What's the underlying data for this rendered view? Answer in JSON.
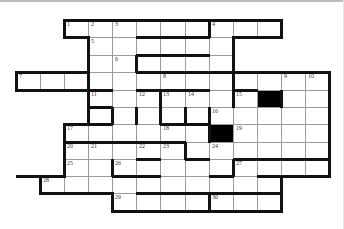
{
  "puzzle": {
    "type": "crossword",
    "colors": {
      "cell": "#ffffff",
      "block": "#000000",
      "thin_line": "#9a9a9a",
      "thick_line": "#111111"
    },
    "col_x": [
      16,
      40,
      64,
      88,
      112,
      136,
      160,
      185,
      209,
      233,
      257,
      281,
      305,
      329
    ],
    "row_y": [
      20,
      37,
      55,
      72,
      90,
      107,
      124,
      142,
      159,
      176,
      193,
      211
    ],
    "rows": [
      {
        "r": 0,
        "from": 2,
        "to": 10
      },
      {
        "r": 1,
        "from": 3,
        "to": 8
      },
      {
        "r": 2,
        "from": 3,
        "to": 8
      },
      {
        "r": 3,
        "from": 0,
        "to": 12
      },
      {
        "r": 4,
        "from": 3,
        "to": 12
      },
      {
        "r": 5,
        "from": 3,
        "to": 12
      },
      {
        "r": 6,
        "from": 2,
        "to": 12
      },
      {
        "r": 7,
        "from": 2,
        "to": 12
      },
      {
        "r": 8,
        "from": 2,
        "to": 12
      },
      {
        "r": 9,
        "from": 1,
        "to": 10
      },
      {
        "r": 10,
        "from": 4,
        "to": 10
      }
    ],
    "blocks": [
      [
        4,
        10
      ],
      [
        6,
        8
      ]
    ],
    "numbers": [
      {
        "n": "1",
        "r": 0,
        "c": 2
      },
      {
        "n": "2",
        "r": 0,
        "c": 3
      },
      {
        "n": "3",
        "r": 0,
        "c": 4
      },
      {
        "n": "4",
        "r": 0,
        "c": 8
      },
      {
        "n": "5",
        "r": 1,
        "c": 3
      },
      {
        "n": "6",
        "r": 2,
        "c": 4
      },
      {
        "n": "7",
        "r": 3,
        "c": 0
      },
      {
        "n": "8",
        "r": 3,
        "c": 6
      },
      {
        "n": "9",
        "r": 3,
        "c": 11
      },
      {
        "n": "10",
        "r": 3,
        "c": 12
      },
      {
        "n": "11",
        "r": 4,
        "c": 3
      },
      {
        "n": "12",
        "r": 4,
        "c": 5
      },
      {
        "n": "13",
        "r": 4,
        "c": 6
      },
      {
        "n": "14",
        "r": 4,
        "c": 7
      },
      {
        "n": "15",
        "r": 4,
        "c": 9
      },
      {
        "n": "16",
        "r": 5,
        "c": 8
      },
      {
        "n": "17",
        "r": 6,
        "c": 2
      },
      {
        "n": "18",
        "r": 6,
        "c": 6
      },
      {
        "n": "19",
        "r": 6,
        "c": 9
      },
      {
        "n": "20",
        "r": 7,
        "c": 2
      },
      {
        "n": "21",
        "r": 7,
        "c": 3
      },
      {
        "n": "22",
        "r": 7,
        "c": 5
      },
      {
        "n": "23",
        "r": 7,
        "c": 6
      },
      {
        "n": "24",
        "r": 7,
        "c": 8
      },
      {
        "n": "25",
        "r": 8,
        "c": 2
      },
      {
        "n": "26",
        "r": 8,
        "c": 4
      },
      {
        "n": "27",
        "r": 8,
        "c": 9
      },
      {
        "n": "28",
        "r": 9,
        "c": 1
      },
      {
        "n": "29",
        "r": 10,
        "c": 4
      },
      {
        "n": "30",
        "r": 10,
        "c": 8
      }
    ],
    "thick_h": [
      [
        0,
        2,
        11
      ],
      [
        1,
        2,
        3
      ],
      [
        1,
        5,
        8
      ],
      [
        1,
        9,
        11
      ],
      [
        2,
        5,
        8
      ],
      [
        3,
        0,
        3
      ],
      [
        3,
        5,
        8
      ],
      [
        3,
        8,
        13
      ],
      [
        4,
        0,
        4
      ],
      [
        4,
        5,
        8
      ],
      [
        4,
        9,
        10
      ],
      [
        5,
        3,
        4
      ],
      [
        6,
        2,
        3
      ],
      [
        6,
        3,
        4
      ],
      [
        6,
        6,
        8
      ],
      [
        7,
        2,
        5
      ],
      [
        7,
        5,
        7
      ],
      [
        8,
        9,
        13
      ],
      [
        9,
        5,
        6
      ],
      [
        9,
        0,
        2
      ],
      [
        9,
        8,
        9
      ],
      [
        9,
        10,
        13
      ],
      [
        10,
        1,
        4
      ],
      [
        10,
        5,
        8
      ],
      [
        10,
        8,
        11
      ],
      [
        11,
        4,
        11
      ],
      [
        8,
        5,
        6
      ],
      [
        8,
        7,
        8
      ],
      [
        9,
        4,
        5
      ]
    ],
    "thick_v": [
      [
        0,
        2,
        1
      ],
      [
        0,
        8,
        1
      ],
      [
        0,
        11,
        1
      ],
      [
        1,
        3,
        3
      ],
      [
        1,
        9,
        3
      ],
      [
        2,
        5,
        1
      ],
      [
        3,
        0,
        1
      ],
      [
        3,
        13,
        6
      ],
      [
        4,
        3,
        2
      ],
      [
        4,
        6,
        2
      ],
      [
        4,
        9,
        1
      ],
      [
        4,
        11,
        1
      ],
      [
        5,
        4,
        1
      ],
      [
        5,
        5,
        1
      ],
      [
        5,
        7,
        1
      ],
      [
        5,
        8,
        1
      ],
      [
        6,
        2,
        3
      ],
      [
        6,
        8,
        1
      ],
      [
        7,
        7,
        1
      ],
      [
        8,
        4,
        1
      ],
      [
        8,
        9,
        1
      ],
      [
        9,
        1,
        1
      ],
      [
        9,
        2,
        0
      ],
      [
        9,
        11,
        1
      ],
      [
        10,
        4,
        1
      ],
      [
        10,
        8,
        1
      ],
      [
        10,
        11,
        1
      ]
    ]
  }
}
